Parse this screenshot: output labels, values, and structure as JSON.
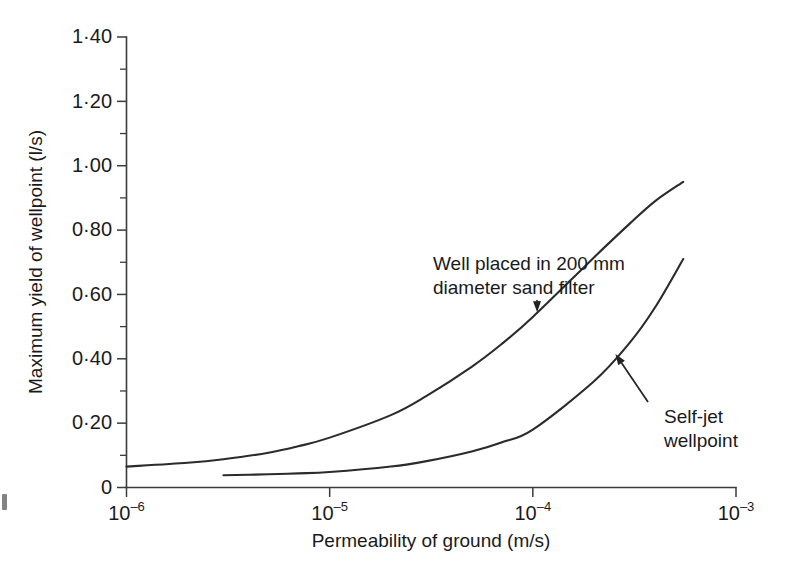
{
  "figure": {
    "name": "maximum-yield-of-wellpoint-vs-permeability",
    "background_color": "#ffffff",
    "line_color": "#2b2b2b",
    "axis_color": "#3b3b3b"
  },
  "chart_data": {
    "type": "line",
    "title": "",
    "xlabel": "Permeability of ground (m/s)",
    "ylabel": "Maximum yield of wellpoint (l/s)",
    "xscale": "log",
    "yscale": "linear",
    "xlim": [
      1e-06,
      0.001
    ],
    "ylim": [
      0,
      1.4
    ],
    "grid": false,
    "legend_position": "none",
    "xticks": [
      {
        "value": 1e-06,
        "base": "10",
        "exponent": "–6",
        "label": "10–6"
      },
      {
        "value": 1e-05,
        "base": "10",
        "exponent": "–5",
        "label": "10–5"
      },
      {
        "value": 0.0001,
        "base": "10",
        "exponent": "–4",
        "label": "10–4"
      },
      {
        "value": 0.001,
        "base": "10",
        "exponent": "–3",
        "label": "10–3"
      }
    ],
    "yticks": [
      {
        "value": 0,
        "label": "0"
      },
      {
        "value": 0.2,
        "label": "0·20"
      },
      {
        "value": 0.4,
        "label": "0·40"
      },
      {
        "value": 0.6,
        "label": "0·60"
      },
      {
        "value": 0.8,
        "label": "0·80"
      },
      {
        "value": 1.0,
        "label": "1·00"
      },
      {
        "value": 1.2,
        "label": "1·20"
      },
      {
        "value": 1.4,
        "label": "1·40"
      }
    ],
    "yticks_minor": [
      0.1,
      0.3,
      0.5,
      0.7,
      0.9,
      1.1,
      1.3
    ],
    "series": [
      {
        "name": "Well placed in 200 mm diameter sand filter",
        "points": [
          {
            "x": 1e-06,
            "y": 0.065
          },
          {
            "x": 2e-06,
            "y": 0.077
          },
          {
            "x": 3e-06,
            "y": 0.088
          },
          {
            "x": 5e-06,
            "y": 0.108
          },
          {
            "x": 7e-06,
            "y": 0.128
          },
          {
            "x": 1e-05,
            "y": 0.155
          },
          {
            "x": 2e-05,
            "y": 0.225
          },
          {
            "x": 3e-05,
            "y": 0.285
          },
          {
            "x": 5e-05,
            "y": 0.375
          },
          {
            "x": 7e-05,
            "y": 0.445
          },
          {
            "x": 0.0001,
            "y": 0.53
          },
          {
            "x": 0.0002,
            "y": 0.715
          },
          {
            "x": 0.0003,
            "y": 0.82
          },
          {
            "x": 0.0004,
            "y": 0.89
          },
          {
            "x": 0.00055,
            "y": 0.95
          }
        ]
      },
      {
        "name": "Self-jet wellpoint",
        "points": [
          {
            "x": 3e-06,
            "y": 0.038
          },
          {
            "x": 5e-06,
            "y": 0.041
          },
          {
            "x": 7e-06,
            "y": 0.044
          },
          {
            "x": 1e-05,
            "y": 0.048
          },
          {
            "x": 2e-05,
            "y": 0.065
          },
          {
            "x": 3e-05,
            "y": 0.082
          },
          {
            "x": 5e-05,
            "y": 0.112
          },
          {
            "x": 7e-05,
            "y": 0.14
          },
          {
            "x": 0.0001,
            "y": 0.18
          },
          {
            "x": 0.0002,
            "y": 0.33
          },
          {
            "x": 0.0003,
            "y": 0.45
          },
          {
            "x": 0.0004,
            "y": 0.56
          },
          {
            "x": 0.00055,
            "y": 0.71
          }
        ]
      }
    ],
    "annotations": [
      {
        "id": "annotation-sand-filter",
        "line1": "Well placed in 200 mm",
        "line2": "diameter sand filter",
        "target_x": 0.000105,
        "target_y": 0.545
      },
      {
        "id": "annotation-self-jet",
        "line1": "Self-jet",
        "line2": "wellpoint",
        "target_x": 0.000255,
        "target_y": 0.415
      }
    ]
  }
}
